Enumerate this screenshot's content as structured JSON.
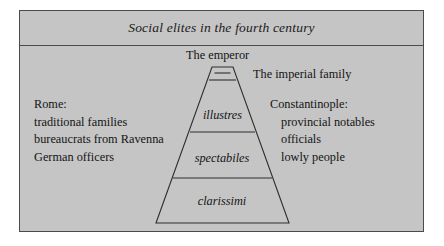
{
  "figure": {
    "title": "Social elites in the fourth century",
    "background_color": "#c5c5c5",
    "border_color": "#4a4a4a"
  },
  "pyramid": {
    "apex_labels": {
      "emperor": "The emperor",
      "imperial_family": "The imperial family"
    },
    "tiers": [
      {
        "name": "illustres",
        "label": "illustres"
      },
      {
        "name": "spectabiles",
        "label": "spectabiles"
      },
      {
        "name": "clarissimi",
        "label": "clarissimi"
      }
    ]
  },
  "left_column": {
    "heading": "Rome:",
    "items": [
      "traditional families",
      "bureaucrats from Ravenna",
      "German officers"
    ]
  },
  "right_column": {
    "heading": "Constantinople:",
    "items": [
      "provincial notables",
      "officials",
      "lowly people"
    ]
  }
}
